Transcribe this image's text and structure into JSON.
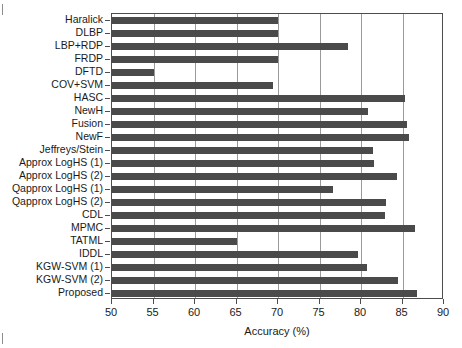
{
  "chart_data": {
    "type": "bar",
    "orientation": "horizontal",
    "title": "",
    "xlabel": "Accuracy (%)",
    "ylabel": "",
    "xlim": [
      50,
      90
    ],
    "xticks": [
      50,
      55,
      60,
      65,
      70,
      75,
      80,
      85,
      90
    ],
    "grid": "vertical",
    "legend": "none",
    "bar_color": "#4a4a4a",
    "categories": [
      "Haralick",
      "DLBP",
      "LBP+RDP",
      "FRDP",
      "DFTD",
      "COV+SVM",
      "HASC",
      "NewH",
      "Fusion",
      "NewF",
      "Jeffreys/Stein",
      "Approx LogHS (1)",
      "Approx LogHS (2)",
      "Qapprox LogHS (1)",
      "Qapprox LogHS (2)",
      "CDL",
      "MPMC",
      "TATML",
      "IDDL",
      "KGW-SVM (1)",
      "KGW-SVM (2)",
      "Proposed"
    ],
    "values": [
      70.0,
      70.0,
      78.4,
      70.0,
      55.1,
      69.4,
      85.3,
      80.8,
      85.5,
      85.8,
      81.5,
      81.6,
      84.3,
      76.6,
      83.0,
      82.9,
      86.5,
      65.0,
      79.6,
      80.7,
      84.4,
      86.7
    ]
  },
  "axis": {
    "x_title": "Accuracy (%)",
    "tick_labels": [
      "50",
      "55",
      "60",
      "65",
      "70",
      "75",
      "80",
      "85",
      "90"
    ]
  }
}
